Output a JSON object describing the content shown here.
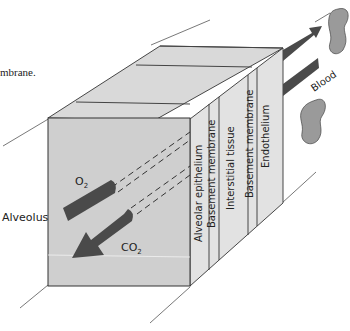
{
  "caption_fragment": "mbrane.",
  "diagram": {
    "left_label": "Alveolus",
    "right_label": "Blood",
    "gases": {
      "o2": {
        "symbol": "O",
        "subscript": "2"
      },
      "co2": {
        "symbol": "CO",
        "subscript": "2"
      }
    },
    "layers": [
      {
        "label": "Alveolar epithelium"
      },
      {
        "label": "Basement membrane"
      },
      {
        "label": "Interstitial tissue"
      },
      {
        "label": "Basement membrane"
      },
      {
        "label": "Endothelium"
      }
    ],
    "colors": {
      "front_face": "#cfcfcf",
      "top_face": "#d9d9d9",
      "side_face": "#e2e2e2",
      "arrow": "#4a4a4a",
      "rbc": "#9a9a9a",
      "line": "#333333"
    }
  }
}
